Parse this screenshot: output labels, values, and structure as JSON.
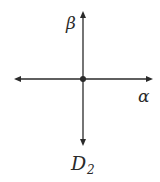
{
  "diagram": {
    "labels": {
      "vertical_axis": "β",
      "horizontal_axis": "α",
      "caption_main": "D",
      "caption_sub": "2"
    },
    "colors": {
      "line": "#2a2a2a",
      "background": "#ffffff"
    },
    "elements": {
      "vertical_axis": {
        "x": 83,
        "y1": 12,
        "y2": 145,
        "arrows": [
          "up",
          "down"
        ]
      },
      "horizontal_axis": {
        "y": 79,
        "x1": 15,
        "x2": 152,
        "arrows": [
          "left",
          "right"
        ]
      },
      "center_point": {
        "x": 83,
        "y": 79
      }
    }
  }
}
